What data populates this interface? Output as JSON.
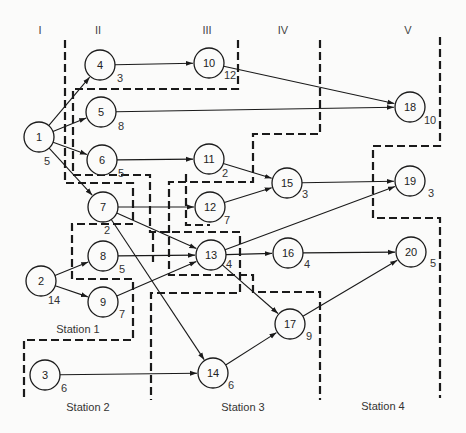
{
  "columns": [
    {
      "label": "I",
      "x": 40
    },
    {
      "label": "II",
      "x": 98
    },
    {
      "label": "III",
      "x": 207
    },
    {
      "label": "IV",
      "x": 283
    },
    {
      "label": "V",
      "x": 408
    }
  ],
  "stations": [
    {
      "label": "Station 1",
      "x": 78,
      "y": 333
    },
    {
      "label": "Station 2",
      "x": 88,
      "y": 411
    },
    {
      "label": "Station 3",
      "x": 243,
      "y": 411
    },
    {
      "label": "Station 4",
      "x": 383,
      "y": 410
    }
  ],
  "nodes": [
    {
      "id": "1",
      "x": 39,
      "y": 137,
      "time": "5",
      "tx": 44,
      "ty": 165
    },
    {
      "id": "2",
      "x": 41,
      "y": 281,
      "time": "14",
      "tx": 48,
      "ty": 304
    },
    {
      "id": "3",
      "x": 45,
      "y": 375,
      "time": "6",
      "tx": 61,
      "ty": 392
    },
    {
      "id": "4",
      "x": 100,
      "y": 65,
      "time": "3",
      "tx": 117,
      "ty": 82
    },
    {
      "id": "5",
      "x": 101,
      "y": 112,
      "time": "8",
      "tx": 118,
      "ty": 130
    },
    {
      "id": "6",
      "x": 102,
      "y": 160,
      "time": "5",
      "tx": 118,
      "ty": 177
    },
    {
      "id": "7",
      "x": 103,
      "y": 207,
      "time": "2",
      "tx": 104,
      "ty": 234
    },
    {
      "id": "8",
      "x": 103,
      "y": 256,
      "time": "5",
      "tx": 119,
      "ty": 273
    },
    {
      "id": "9",
      "x": 103,
      "y": 302,
      "time": "7",
      "tx": 119,
      "ty": 318
    },
    {
      "id": "10",
      "x": 209,
      "y": 63,
      "time": "12",
      "tx": 224,
      "ty": 79
    },
    {
      "id": "11",
      "x": 209,
      "y": 159,
      "time": "2",
      "tx": 222,
      "ty": 177
    },
    {
      "id": "12",
      "x": 210,
      "y": 207,
      "time": "7",
      "tx": 224,
      "ty": 224
    },
    {
      "id": "13",
      "x": 211,
      "y": 255,
      "time": "4",
      "tx": 226,
      "ty": 268
    },
    {
      "id": "14",
      "x": 213,
      "y": 373,
      "time": "6",
      "tx": 228,
      "ty": 389
    },
    {
      "id": "15",
      "x": 287,
      "y": 183,
      "time": "3",
      "tx": 302,
      "ty": 198
    },
    {
      "id": "16",
      "x": 288,
      "y": 253,
      "time": "4",
      "tx": 304,
      "ty": 268
    },
    {
      "id": "17",
      "x": 290,
      "y": 324,
      "time": "9",
      "tx": 306,
      "ty": 340
    },
    {
      "id": "18",
      "x": 410,
      "y": 107,
      "time": "10",
      "tx": 424,
      "ty": 124
    },
    {
      "id": "19",
      "x": 410,
      "y": 181,
      "time": "3",
      "tx": 428,
      "ty": 197
    },
    {
      "id": "20",
      "x": 411,
      "y": 252,
      "time": "5",
      "tx": 430,
      "ty": 267
    }
  ],
  "edges": [
    [
      "1",
      "4"
    ],
    [
      "1",
      "5"
    ],
    [
      "1",
      "6"
    ],
    [
      "1",
      "7"
    ],
    [
      "2",
      "8"
    ],
    [
      "2",
      "9"
    ],
    [
      "3",
      "14"
    ],
    [
      "4",
      "10"
    ],
    [
      "5",
      "18"
    ],
    [
      "6",
      "11"
    ],
    [
      "7",
      "12"
    ],
    [
      "7",
      "13"
    ],
    [
      "7",
      "14"
    ],
    [
      "8",
      "13"
    ],
    [
      "9",
      "13"
    ],
    [
      "10",
      "18"
    ],
    [
      "11",
      "15"
    ],
    [
      "12",
      "15"
    ],
    [
      "13",
      "16"
    ],
    [
      "13",
      "17"
    ],
    [
      "13",
      "19"
    ],
    [
      "14",
      "17"
    ],
    [
      "15",
      "19"
    ],
    [
      "16",
      "20"
    ],
    [
      "17",
      "20"
    ]
  ],
  "station_boundaries": [
    "M65,40 L65,183 L133,183 L133,224 L72,224 L72,279 L133,279 L133,340 L24,340 L24,400",
    "M238,40 L238,89 L73,89 L73,175 L150,175 L150,232 L240,232 L240,293 L151,293 L151,400",
    "M320,40 L320,134 L253,134 L253,182 L169,182 L169,275 L253,275 L253,292 L320,292 L320,400",
    "M440,37 L440,146 L373,146 L373,218 L440,218 L440,398",
    "M186,174 L186,225 L210,225",
    "M153,232 L153,262"
  ]
}
